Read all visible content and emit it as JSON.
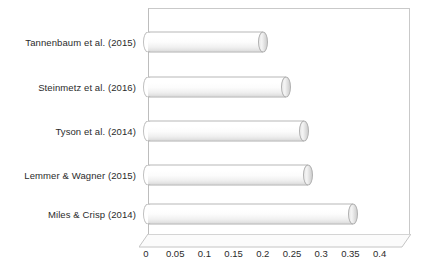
{
  "chart_data": {
    "type": "bar",
    "orientation": "horizontal",
    "style": "3d-cylinder",
    "title": "",
    "xlabel": "",
    "ylabel": "",
    "categories": [
      "Tannenbaum et al. (2015)",
      "Steinmetz et al. (2016)",
      "Tyson et al. (2014)",
      "Lemmer & Wagner (2015)",
      "Miles & Crisp (2014)"
    ],
    "values": [
      0.205,
      0.245,
      0.275,
      0.283,
      0.36
    ],
    "xlim": [
      0,
      0.4
    ],
    "xticks": [
      0,
      0.05,
      0.1,
      0.15,
      0.2,
      0.25,
      0.3,
      0.35,
      0.4
    ],
    "xticklabels": [
      "0",
      "0.05",
      "0.1",
      "0.15",
      "0.2",
      "0.25",
      "0.3",
      "0.35",
      "0.4"
    ],
    "grid": false,
    "legend": false,
    "colors": {
      "bar_fill": "#ffffff",
      "bar_edge": "#b0b0b0",
      "frame": "#c9c9c9",
      "text": "#2b2b2b",
      "background": "#ffffff"
    }
  }
}
